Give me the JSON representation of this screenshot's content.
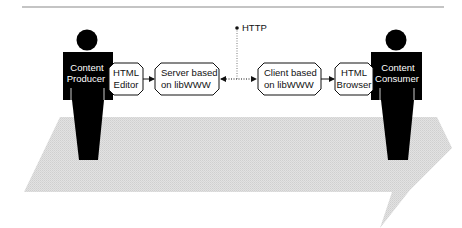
{
  "diagram": {
    "type": "web-architecture-flow",
    "colors": {
      "figure": "#000000",
      "box_fill": "#ffffff",
      "box_stroke": "#111111",
      "arrow_band": "#d9d9d9",
      "rule": "#8a8a8a",
      "text_on_figure": "#ffffff"
    },
    "actors": [
      {
        "id": "producer",
        "line1": "Content",
        "line2": "Producer"
      },
      {
        "id": "consumer",
        "line1": "Content",
        "line2": "Consumer"
      }
    ],
    "nodes": [
      {
        "id": "html-editor",
        "line1": "HTML",
        "line2": "Editor"
      },
      {
        "id": "server",
        "line1": "Server based",
        "line2": "on libWWW"
      },
      {
        "id": "client",
        "line1": "Client based",
        "line2": "on libWWW"
      },
      {
        "id": "html-browser",
        "line1": "HTML",
        "line2": "Browser"
      }
    ],
    "protocol_label": "HTTP",
    "edges": [
      {
        "from": "html-editor",
        "to": "server",
        "style": "solid"
      },
      {
        "from": "server",
        "to": "client",
        "style": "dotted-bidirectional",
        "label": "HTTP"
      },
      {
        "from": "client",
        "to": "html-browser",
        "style": "solid"
      }
    ]
  }
}
